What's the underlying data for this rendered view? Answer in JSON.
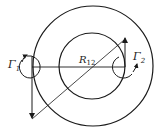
{
  "diagram": {
    "labels": {
      "gamma1": "Γ",
      "gamma1_sub": "1",
      "gamma2": "Γ",
      "gamma2_sub": "2",
      "distance": "R",
      "distance_sub": "12"
    },
    "colors": {
      "stroke": "#1a1a1a",
      "background": "#ffffff"
    }
  }
}
